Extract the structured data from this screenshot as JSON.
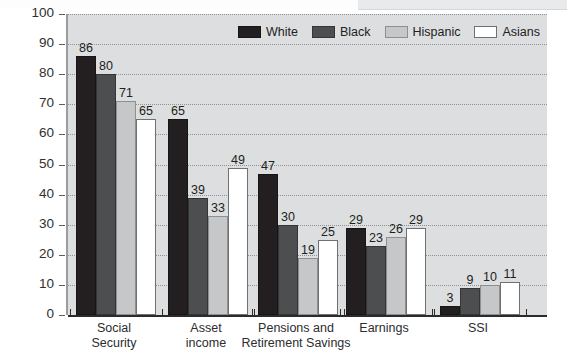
{
  "chart_data": {
    "type": "bar",
    "title": "",
    "xlabel": "",
    "ylabel": "Percent",
    "ylim": [
      0,
      100
    ],
    "ytick_step": 10,
    "yticks": [
      0,
      10,
      20,
      30,
      40,
      50,
      60,
      70,
      80,
      90,
      100
    ],
    "grid": true,
    "legend_position": "top-right",
    "categories": [
      "Social\nSecurity",
      "Asset\nincome",
      "Pensions  and\nRetirement Savings",
      "Earnings",
      "SSI"
    ],
    "series": [
      {
        "name": "White",
        "color": "#231f20",
        "values": [
          86,
          65,
          47,
          29,
          3
        ]
      },
      {
        "name": "Black",
        "color": "#4d4e50",
        "values": [
          80,
          39,
          30,
          23,
          9
        ]
      },
      {
        "name": "Hispanic",
        "color": "#c6c7c9",
        "values": [
          71,
          33,
          19,
          26,
          10
        ]
      },
      {
        "name": "Asians",
        "color": "#ffffff",
        "values": [
          65,
          49,
          25,
          29,
          11
        ]
      }
    ]
  },
  "legend": {
    "items": [
      {
        "label": "White"
      },
      {
        "label": "Black"
      },
      {
        "label": "Hispanic"
      },
      {
        "label": "Asians"
      }
    ]
  },
  "axis": {
    "y_title": "Percent",
    "y_labels": [
      "100",
      "90",
      "80",
      "70",
      "60",
      "50",
      "40",
      "30",
      "20",
      "10",
      "0"
    ]
  },
  "colors": {
    "plot_background": "#dcdee0",
    "page_background": "#ffffff",
    "gridline": "#8f9193",
    "axis": "#2b2b2b",
    "text": "#1f2123"
  }
}
